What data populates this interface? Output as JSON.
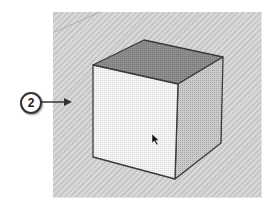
{
  "callout": {
    "number": "2",
    "arrow": "right"
  },
  "scene": {
    "background": "#cfcfcf",
    "axis_line": {
      "from": [
        55,
        32
      ],
      "to": [
        100,
        12
      ],
      "color": "#b9a9a9"
    },
    "cube": {
      "top_face_color": "#8a8a8a",
      "front_face_color": "#f2f2f2",
      "right_face_color": "#c4c4c4",
      "edge_color": "#3a3a3a"
    },
    "cursor": {
      "x": 153,
      "y": 136
    }
  }
}
